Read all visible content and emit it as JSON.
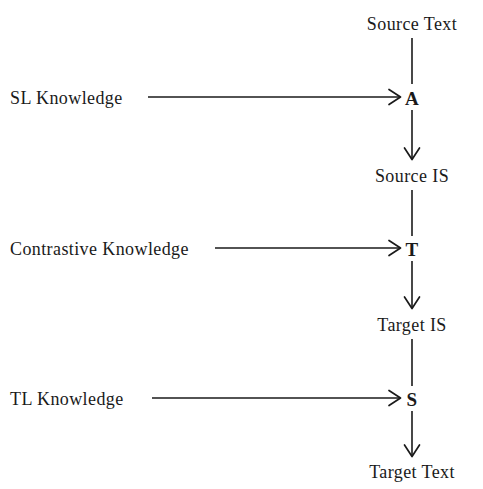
{
  "diagram": {
    "background_color": "#ffffff",
    "stroke_color": "#1a1a1a",
    "spine": {
      "stages": [
        {
          "id": "source-text",
          "label": "Source Text",
          "x": 412,
          "y": 24
        },
        {
          "id": "operator-a",
          "label": "A",
          "x": 412,
          "y": 99
        },
        {
          "id": "source-is",
          "label": "Source IS",
          "x": 412,
          "y": 176
        },
        {
          "id": "operator-t",
          "label": "T",
          "x": 412,
          "y": 250
        },
        {
          "id": "target-is",
          "label": "Target IS",
          "x": 412,
          "y": 325
        },
        {
          "id": "operator-s",
          "label": "S",
          "x": 412,
          "y": 400
        },
        {
          "id": "target-text",
          "label": "Target Text",
          "x": 412,
          "y": 472
        }
      ],
      "connectors": [
        {
          "from": "source-text",
          "to": "operator-a",
          "arrowhead": false
        },
        {
          "from": "operator-a",
          "to": "source-is",
          "arrowhead": true
        },
        {
          "from": "source-is",
          "to": "operator-t",
          "arrowhead": false
        },
        {
          "from": "operator-t",
          "to": "target-is",
          "arrowhead": true
        },
        {
          "from": "target-is",
          "to": "operator-s",
          "arrowhead": false
        },
        {
          "from": "operator-s",
          "to": "target-text",
          "arrowhead": true
        }
      ]
    },
    "inputs": [
      {
        "id": "sl-knowledge",
        "label": "SL Knowledge",
        "target": "operator-a",
        "x": 10,
        "y": 99,
        "arrow_start_x": 148,
        "arrow_end_x": 400,
        "arrow_y": 97,
        "arrowhead": true
      },
      {
        "id": "contrastive-knowledge",
        "label": "Contrastive Knowledge",
        "target": "operator-t",
        "x": 10,
        "y": 250,
        "arrow_start_x": 215,
        "arrow_end_x": 400,
        "arrow_y": 248,
        "arrowhead": true
      },
      {
        "id": "tl-knowledge",
        "label": "TL Knowledge",
        "target": "operator-s",
        "x": 10,
        "y": 400,
        "arrow_start_x": 152,
        "arrow_end_x": 400,
        "arrow_y": 398,
        "arrowhead": true
      }
    ]
  }
}
